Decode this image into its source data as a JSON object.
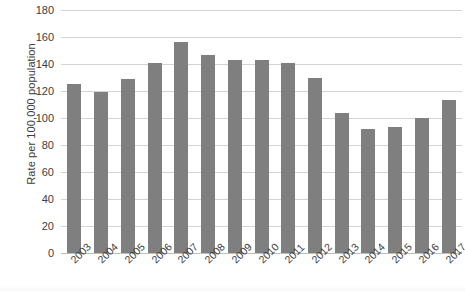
{
  "chart_data": {
    "type": "bar",
    "title": "",
    "xlabel": "",
    "ylabel": "Rate per 100,000 population",
    "categories": [
      "2003",
      "2004",
      "2005",
      "2006",
      "2007",
      "2008",
      "2009",
      "2010",
      "2011",
      "2012",
      "2013",
      "2014",
      "2015",
      "2016",
      "2017"
    ],
    "values": [
      125,
      119,
      129,
      141,
      156,
      147,
      143,
      143,
      141,
      130,
      104,
      92,
      93,
      100,
      113
    ],
    "series": [
      {
        "name": "Rate per 100,000 population",
        "values": [
          125,
          119,
          129,
          141,
          156,
          147,
          143,
          143,
          141,
          130,
          104,
          92,
          93,
          100,
          113
        ]
      }
    ],
    "ylim": [
      0,
      180
    ],
    "ytick_labels": [
      "180",
      "160",
      "140",
      "120",
      "100",
      "80",
      "60",
      "40",
      "20",
      "0"
    ],
    "ytick_values": [
      180,
      160,
      140,
      120,
      100,
      80,
      60,
      40,
      20,
      0
    ],
    "ytick_step": 20,
    "grid": true,
    "grid_axis": "y",
    "legend": false,
    "legend_position": "none",
    "bar_color": "#7f7f7f",
    "grid_color": "#d4d4d4",
    "axis_color": "#bdbdbd",
    "text_color": "#3d3d3d",
    "background": "#ffffff",
    "xtick_rotation": -45
  }
}
